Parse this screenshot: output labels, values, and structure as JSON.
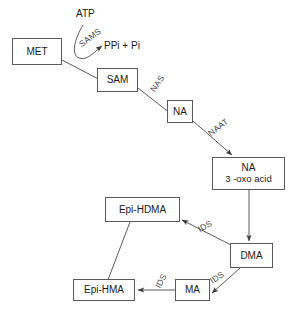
{
  "diagram": {
    "background_color": "#ffffff",
    "line_color": "#5a5a5a",
    "text_color": "#1a1a1a",
    "enzyme_text_color": "#4a4a4a",
    "nodes": [
      {
        "id": "met",
        "label": "MET",
        "label2": ""
      },
      {
        "id": "sam",
        "label": "SAM",
        "label2": ""
      },
      {
        "id": "na",
        "label": "NA",
        "label2": ""
      },
      {
        "id": "naoxo",
        "label": "NA",
        "label2": "3  -oxo acid"
      },
      {
        "id": "epihdma",
        "label": "Epi-HDMA",
        "label2": ""
      },
      {
        "id": "dma",
        "label": "DMA",
        "label2": ""
      },
      {
        "id": "epihma",
        "label": "Epi-HMA",
        "label2": ""
      },
      {
        "id": "ma",
        "label": "MA",
        "label2": ""
      }
    ],
    "substrate_labels": [
      {
        "id": "atp",
        "text": "ATP"
      },
      {
        "id": "ppi_pi",
        "text": "PPi + Pi"
      }
    ],
    "enzyme_labels": [
      {
        "id": "sams",
        "text": "SAMS"
      },
      {
        "id": "nas",
        "text": "NAS"
      },
      {
        "id": "naat",
        "text": "NAAT"
      },
      {
        "id": "ids1",
        "text": "IDS"
      },
      {
        "id": "ids2",
        "text": "IDS"
      },
      {
        "id": "ids3",
        "text": "IDS"
      }
    ],
    "edges": [
      {
        "from": "met",
        "to": "sam",
        "enzyme": "SAMS"
      },
      {
        "from": "sam",
        "to": "na",
        "enzyme": "NAS"
      },
      {
        "from": "na",
        "to": "naoxo",
        "enzyme": "NAAT"
      },
      {
        "from": "naoxo",
        "to": "dma",
        "enzyme": ""
      },
      {
        "from": "dma",
        "to": "epihdma",
        "enzyme": "IDS"
      },
      {
        "from": "dma",
        "to": "ma",
        "enzyme": "IDS"
      },
      {
        "from": "ma",
        "to": "epihma",
        "enzyme": "IDS"
      },
      {
        "from": "epihdma",
        "to": "epihma",
        "enzyme": ""
      }
    ]
  }
}
